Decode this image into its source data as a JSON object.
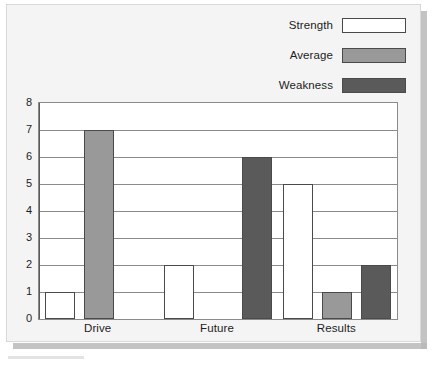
{
  "chart_data": {
    "type": "bar",
    "title": "",
    "subtitle": "",
    "xlabel": "",
    "ylabel": "",
    "categories": [
      "Drive",
      "Future",
      "Results"
    ],
    "series": [
      {
        "name": "Strength",
        "color": "#ffffff",
        "values": [
          1,
          2,
          5
        ]
      },
      {
        "name": "Average",
        "color": "#999999",
        "values": [
          7,
          0,
          1
        ]
      },
      {
        "name": "Weakness",
        "color": "#5a5a5a",
        "values": [
          0,
          6,
          2
        ]
      }
    ],
    "ylim": [
      0,
      8
    ],
    "yticks": [
      "0",
      "1",
      "2",
      "3",
      "4",
      "5",
      "6",
      "7",
      "8"
    ],
    "grid": true,
    "legend_position": "top-right",
    "bar_border_color": "#4a4a4a"
  },
  "legend": {
    "items": [
      {
        "label": "Strength",
        "color": "#ffffff"
      },
      {
        "label": "Average",
        "color": "#999999"
      },
      {
        "label": "Weakness",
        "color": "#5a5a5a"
      }
    ]
  }
}
